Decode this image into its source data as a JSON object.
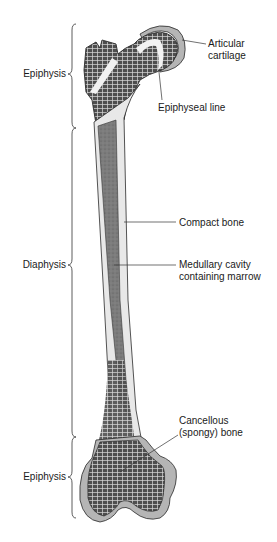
{
  "diagram": {
    "type": "anatomical-illustration",
    "regions": [
      {
        "id": "epiphysis-proximal",
        "label": "Epiphysis"
      },
      {
        "id": "diaphysis",
        "label": "Diaphysis"
      },
      {
        "id": "epiphysis-distal",
        "label": "Epiphysis"
      }
    ],
    "callouts": [
      {
        "id": "articular-cartilage",
        "lines": [
          "Articular",
          "cartilage"
        ]
      },
      {
        "id": "epiphyseal-line",
        "lines": [
          "Epiphyseal line"
        ]
      },
      {
        "id": "compact-bone",
        "lines": [
          "Compact bone"
        ]
      },
      {
        "id": "medullary-cavity",
        "lines": [
          "Medullary cavity",
          "containing marrow"
        ]
      },
      {
        "id": "cancellous-bone",
        "lines": [
          "Cancellous",
          "(spongy) bone"
        ]
      }
    ],
    "colors": {
      "outline": "#2a2a2a",
      "spongy": "#5a5a5a",
      "marrow": "#7a7a7a",
      "compact": "#e6e6e6",
      "cartilage": "#b5b5b5",
      "background": "#ffffff"
    }
  }
}
